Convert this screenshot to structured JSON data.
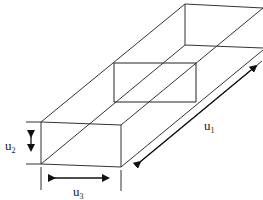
{
  "diagram": {
    "type": "3d-rectangular-duct",
    "stroke_color": "#333333",
    "labels": {
      "u1": {
        "base": "u",
        "sub": "1"
      },
      "u2": {
        "base": "u",
        "sub": "2"
      },
      "u3": {
        "base": "u",
        "sub": "3"
      }
    },
    "dimensions": [
      {
        "name": "u1",
        "meaning": "length along duct axis"
      },
      {
        "name": "u2",
        "meaning": "height of cross-section"
      },
      {
        "name": "u3",
        "meaning": "width of cross-section"
      }
    ]
  }
}
